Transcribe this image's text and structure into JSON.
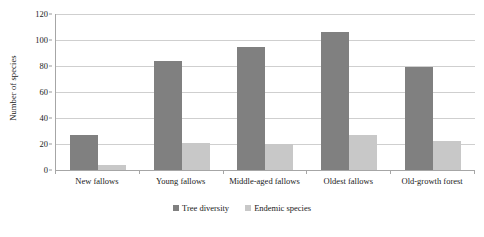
{
  "chart_data": {
    "type": "bar",
    "title": "",
    "subtitle": "",
    "xlabel": "",
    "ylabel": "Number of species",
    "ylim": [
      0,
      120
    ],
    "ytick_step": 20,
    "yticks": [
      0,
      20,
      40,
      60,
      80,
      100,
      120
    ],
    "ytick_labels": [
      "0",
      "20",
      "40",
      "60",
      "80",
      "100",
      "120"
    ],
    "grid": "horizontal",
    "legend_position": "bottom-center",
    "grouping": "grouped",
    "categories": [
      "New fallows",
      "Young fallows",
      "Middle-aged fallows",
      "Oldest fallows",
      "Old-growth forest"
    ],
    "series": [
      {
        "name": "Tree diversity",
        "color": "#808080",
        "values": [
          27,
          84,
          95,
          106,
          79
        ]
      },
      {
        "name": "Endemic species",
        "color": "#c8c8c8",
        "values": [
          4,
          21,
          20,
          27,
          22
        ]
      }
    ]
  },
  "axes": {
    "y_title": "Number of species"
  },
  "colors": {
    "tree_diversity": "#808080",
    "endemic_species": "#c8c8c8",
    "gridline": "#cfcfcf",
    "axis": "#a6a6a6",
    "background": "#ffffff",
    "text": "#1a1a1a"
  }
}
